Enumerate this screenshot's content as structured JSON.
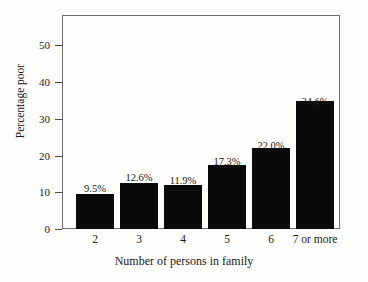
{
  "chart_data": {
    "type": "bar",
    "title": "",
    "subtitle": "",
    "xlabel": "Number of persons in family",
    "ylabel": "Percentage poor",
    "categories": [
      "2",
      "3",
      "4",
      "5",
      "6",
      "7 or more"
    ],
    "values": [
      9.5,
      12.6,
      11.9,
      17.3,
      22.0,
      34.6
    ],
    "data_labels": [
      "9.5%",
      "12.6%",
      "11.9%",
      "17.3%",
      "22.0%",
      "34.6%"
    ],
    "ylim": [
      0,
      58
    ],
    "yticks": [
      0,
      10,
      20,
      30,
      40,
      50
    ],
    "ytick_labels": [
      "0",
      "10",
      "20",
      "30",
      "40",
      "50"
    ],
    "grid": false,
    "legend": null,
    "legend_position": "none",
    "bar_color": "#0a0a0a",
    "frame_color": "#6e6e6e",
    "background_color": "#fdfdfb",
    "text_color": "#1a1a1a"
  }
}
